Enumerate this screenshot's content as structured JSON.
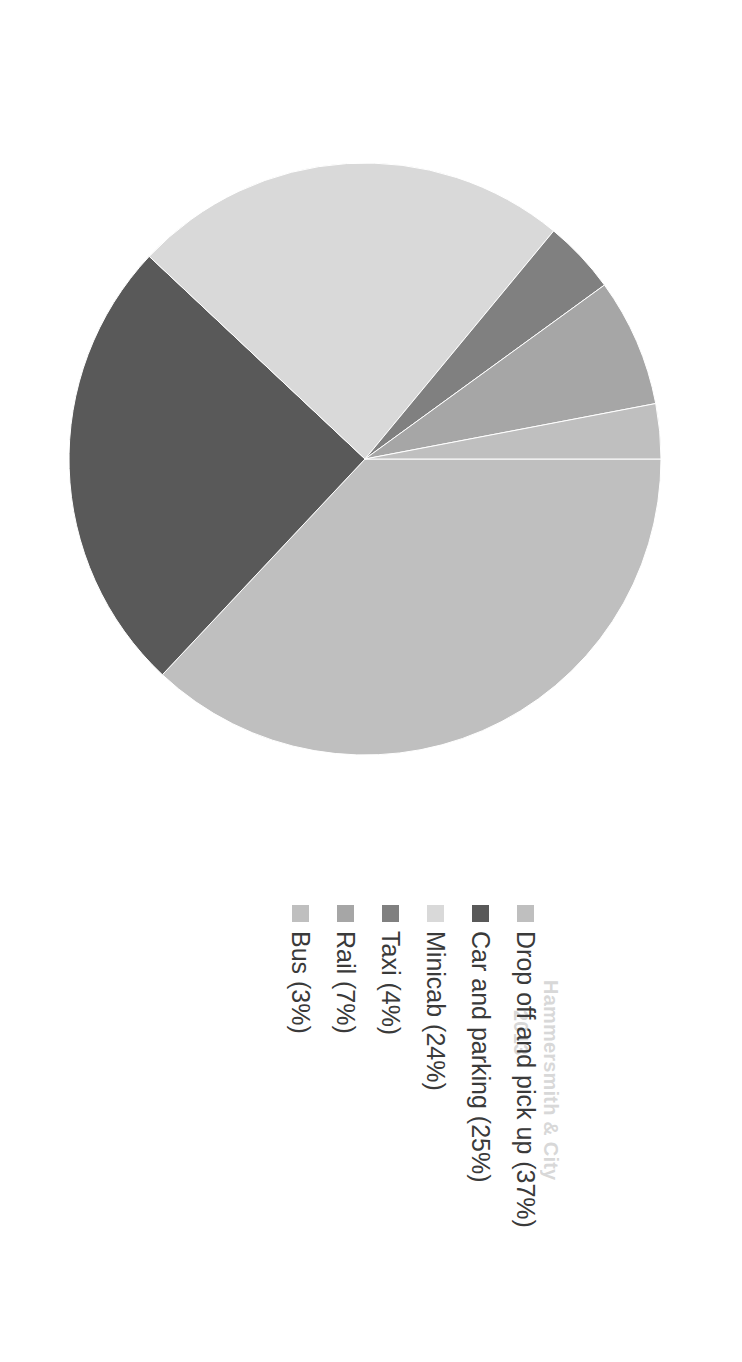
{
  "figure": {
    "rotation_degrees": 90,
    "background_color": "#ffffff"
  },
  "ghost": {
    "line1": "Hammersmith & City",
    "line2": "2013"
  },
  "legend": {
    "position": "bottom",
    "items": [
      {
        "label": "Drop off and pick up (37%)",
        "color": "#bfbfbf"
      },
      {
        "label": "Car and parking (25%)",
        "color": "#595959"
      },
      {
        "label": "Minicab (24%)",
        "color": "#d9d9d9"
      },
      {
        "label": "Taxi (4%)",
        "color": "#808080"
      },
      {
        "label": "Rail (7%)",
        "color": "#a6a6a6"
      },
      {
        "label": "Bus (3%)",
        "color": "#bfbfbf"
      }
    ]
  },
  "chart_data": {
    "type": "pie",
    "title": "",
    "subtitle": "",
    "xlabel": "",
    "ylabel": "",
    "grid": false,
    "legend_position": "bottom",
    "start_angle_degrees": 0,
    "direction": "clockwise",
    "units": "percent",
    "labels": [
      "Drop off and pick up",
      "Car and parking",
      "Minicab",
      "Taxi",
      "Rail",
      "Bus"
    ],
    "values": [
      37,
      25,
      24,
      4,
      7,
      3
    ],
    "value_labels": [
      "37%",
      "25%",
      "24%",
      "4%",
      "7%",
      "3%"
    ],
    "colors": [
      "#bfbfbf",
      "#595959",
      "#d9d9d9",
      "#808080",
      "#a6a6a6",
      "#bfbfbf"
    ],
    "slices": [
      {
        "label": "Drop off and pick up",
        "value": 37,
        "display": "37%",
        "color": "#bfbfbf"
      },
      {
        "label": "Car and parking",
        "value": 25,
        "display": "25%",
        "color": "#595959"
      },
      {
        "label": "Minicab",
        "value": 24,
        "display": "24%",
        "color": "#d9d9d9"
      },
      {
        "label": "Taxi",
        "value": 4,
        "display": "4%",
        "color": "#808080"
      },
      {
        "label": "Rail",
        "value": 7,
        "display": "7%",
        "color": "#a6a6a6"
      },
      {
        "label": "Bus",
        "value": 3,
        "display": "3%",
        "color": "#bfbfbf"
      }
    ],
    "total": 100
  }
}
